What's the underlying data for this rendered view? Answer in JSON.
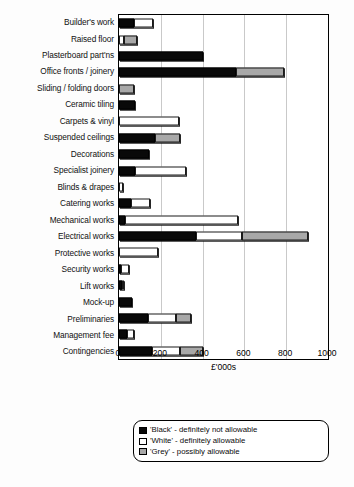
{
  "chart_data": {
    "type": "bar",
    "orientation": "horizontal",
    "stacked": true,
    "title": "",
    "xlabel": "£'000s",
    "ylabel": "",
    "xlim": [
      0,
      1000
    ],
    "xticks": [
      0,
      200,
      400,
      600,
      800,
      1000
    ],
    "grid": true,
    "legend_position": "below",
    "categories": [
      "Builder's work",
      "Raised floor",
      "Plasterboard part'ns",
      "Office fronts / joinery",
      "Sliding / folding doors",
      "Ceramic tiling",
      "Carpets & vinyl",
      "Suspended ceilings",
      "Decorations",
      "Specialist joinery",
      "Blinds & drapes",
      "Catering works",
      "Mechanical works",
      "Electrical works",
      "Protective works",
      "Security works",
      "Lift works",
      "Mock-up",
      "Preliminaries",
      "Management fee",
      "Contingencies"
    ],
    "series": [
      {
        "name": "'Black' - definitely not allowable",
        "key": "black",
        "color": "#090909",
        "values": [
          70,
          0,
          400,
          560,
          0,
          75,
          0,
          170,
          145,
          75,
          0,
          58,
          30,
          370,
          0,
          10,
          12,
          60,
          140,
          40,
          160
        ]
      },
      {
        "name": "'White' - definitely allowable",
        "key": "white",
        "color": "#ffffff",
        "values": [
          95,
          25,
          0,
          0,
          0,
          0,
          285,
          0,
          0,
          245,
          18,
          92,
          540,
          220,
          185,
          38,
          3,
          0,
          135,
          30,
          130
        ]
      },
      {
        "name": "'Grey' - possibly allowable",
        "key": "grey",
        "color": "#a8a8a8",
        "values": [
          0,
          60,
          0,
          230,
          70,
          0,
          0,
          120,
          0,
          0,
          0,
          0,
          0,
          315,
          0,
          0,
          0,
          0,
          70,
          0,
          110
        ]
      }
    ],
    "totals": [
      165,
      85,
      400,
      790,
      70,
      75,
      285,
      290,
      145,
      320,
      18,
      150,
      570,
      905,
      185,
      48,
      15,
      60,
      345,
      70,
      400
    ]
  },
  "legend": {
    "items": [
      {
        "swatch": "black",
        "label": "'Black' - definitely not allowable"
      },
      {
        "swatch": "white",
        "label": "'White' - definitely allowable"
      },
      {
        "swatch": "grey",
        "label": "'Grey' - possibly allowable"
      }
    ]
  }
}
